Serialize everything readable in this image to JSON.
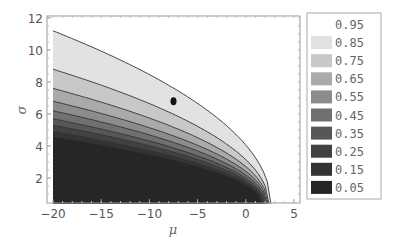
{
  "chart_data": {
    "type": "contour",
    "title": "",
    "xlabel": "μ",
    "ylabel": "σ",
    "xlim": [
      -20,
      5
    ],
    "ylim": [
      0.4,
      12.2
    ],
    "x_ticks": [
      -20,
      -15,
      -10,
      -5,
      0,
      5
    ],
    "x_tick_labels": [
      "-20",
      "-15",
      "-10",
      "-5",
      "0",
      "5"
    ],
    "y_ticks": [
      2,
      4,
      6,
      8,
      10,
      12
    ],
    "y_tick_labels": [
      "2",
      "4",
      "6",
      "8",
      "10",
      "12"
    ],
    "grid": false,
    "legend_position": "right",
    "legend": [
      {
        "label": "0.95",
        "color": "#ffffff"
      },
      {
        "label": "0.85",
        "color": "#e2e2e2"
      },
      {
        "label": "0.75",
        "color": "#c8c8c8"
      },
      {
        "label": "0.65",
        "color": "#aaaaaa"
      },
      {
        "label": "0.55",
        "color": "#8c8c8c"
      },
      {
        "label": "0.45",
        "color": "#707070"
      },
      {
        "label": "0.35",
        "color": "#575757"
      },
      {
        "label": "0.25",
        "color": "#424242"
      },
      {
        "label": "0.15",
        "color": "#333333"
      },
      {
        "label": "0.05",
        "color": "#262626"
      }
    ],
    "contour_boundaries": [
      {
        "level": 0.9,
        "sigma_at_mu_minus20": 11.2,
        "mu_at_sigma_min": 2.6
      },
      {
        "level": 0.8,
        "sigma_at_mu_minus20": 8.8,
        "mu_at_sigma_min": 2.4
      },
      {
        "level": 0.7,
        "sigma_at_mu_minus20": 7.6,
        "mu_at_sigma_min": 2.3
      },
      {
        "level": 0.6,
        "sigma_at_mu_minus20": 6.8,
        "mu_at_sigma_min": 2.2
      },
      {
        "level": 0.5,
        "sigma_at_mu_minus20": 6.2,
        "mu_at_sigma_min": 2.1
      },
      {
        "level": 0.4,
        "sigma_at_mu_minus20": 5.7,
        "mu_at_sigma_min": 2.0
      },
      {
        "level": 0.3,
        "sigma_at_mu_minus20": 5.3,
        "mu_at_sigma_min": 1.9
      },
      {
        "level": 0.2,
        "sigma_at_mu_minus20": 4.9,
        "mu_at_sigma_min": 1.8
      },
      {
        "level": 0.1,
        "sigma_at_mu_minus20": 4.6,
        "mu_at_sigma_min": 1.7
      }
    ],
    "annotations": [
      {
        "type": "point",
        "mu": -7.5,
        "sigma": 6.8,
        "color": "#111111"
      }
    ]
  }
}
